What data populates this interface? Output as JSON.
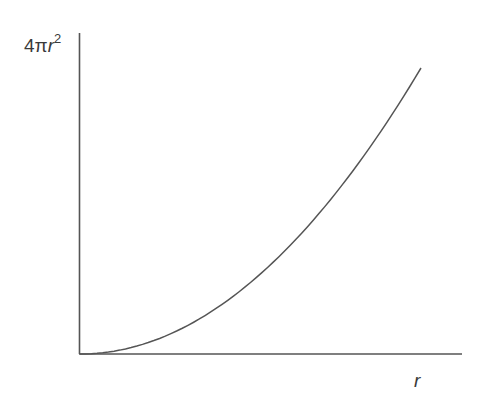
{
  "chart_data": {
    "type": "line",
    "title": "",
    "xlabel": "r",
    "ylabel": "4πr²",
    "ylabel_parts": {
      "prefix": "4π",
      "var": "r",
      "exp": "2"
    },
    "grid": false,
    "legend": null,
    "ticks": "none",
    "series": [
      {
        "name": "4πr²",
        "function": "y = 4*pi*r^2",
        "x": [
          0,
          0.1,
          0.2,
          0.3,
          0.4,
          0.5,
          0.6,
          0.7,
          0.8,
          0.9,
          1.0
        ],
        "values": [
          0,
          0.01,
          0.04,
          0.09,
          0.16,
          0.25,
          0.36,
          0.49,
          0.64,
          0.81,
          1.0
        ],
        "note": "normalized; axes unlabeled numerically"
      }
    ],
    "xlim": [
      0,
      1.12
    ],
    "ylim": [
      0,
      1.1
    ],
    "colors": {
      "axis": "#555555",
      "curve": "#555555",
      "text": "#3a3a3a"
    }
  }
}
